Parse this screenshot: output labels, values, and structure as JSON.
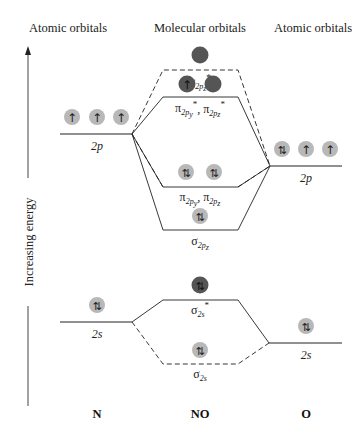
{
  "headers": {
    "left": "Atomic orbitals",
    "center": "Molecular orbitals",
    "right": "Atomic orbitals"
  },
  "axis": {
    "label": "Increasing energy"
  },
  "atoms": {
    "left": {
      "symbol": "N",
      "orbitals": [
        {
          "name": "2p",
          "electrons": [
            "↑",
            "↑",
            "↑"
          ]
        },
        {
          "name": "2s",
          "electrons": [
            "⇅"
          ]
        }
      ]
    },
    "center": {
      "symbol": "NO"
    },
    "right": {
      "symbol": "O",
      "orbitals": [
        {
          "name": "2p",
          "electrons": [
            "⇅",
            "↑",
            "↑"
          ]
        },
        {
          "name": "2s",
          "electrons": [
            "⇅"
          ]
        }
      ]
    }
  },
  "molecular_orbitals": [
    {
      "id": "sigma2pz_star",
      "label": "σ",
      "sub": "2p",
      "subsub": "z",
      "star": "*",
      "electrons": [
        ""
      ],
      "fill": "dark"
    },
    {
      "id": "pi2p_star",
      "label": "π",
      "sub": "2p",
      "subsub1": "y",
      "subsub2": "z",
      "star": "*",
      "electrons": [
        "↑",
        ""
      ],
      "fill": "dark"
    },
    {
      "id": "pi2p",
      "label": "π",
      "sub": "2p",
      "subsub1": "y",
      "subsub2": "z",
      "electrons": [
        "⇅",
        "⇅"
      ],
      "fill": "light"
    },
    {
      "id": "sigma2pz",
      "label": "σ",
      "sub": "2p",
      "subsub": "z",
      "electrons": [
        "⇅"
      ],
      "fill": "light"
    },
    {
      "id": "sigma2s_star",
      "label": "σ",
      "sub": "2s",
      "star": "*",
      "electrons": [
        "⇅"
      ],
      "fill": "dark"
    },
    {
      "id": "sigma2s",
      "label": "σ",
      "sub": "2s",
      "electrons": [
        "⇅"
      ],
      "fill": "light"
    }
  ],
  "labels": {
    "n_2p": "2p",
    "o_2p": "2p",
    "n_2s": "2s",
    "o_2s": "2s",
    "sigma": "σ",
    "pi": "π",
    "star": "*",
    "comma": ",",
    "sub_2p": "2p",
    "sub_2s": "2s",
    "x": "x",
    "y": "y",
    "z": "z"
  },
  "electrons": {
    "up": "↑",
    "pair": "⇅"
  },
  "bottom": {
    "left": "N",
    "center": "NO",
    "right": "O"
  },
  "colors": {
    "light_orbital": "#b8b8b8",
    "dark_orbital": "#555555",
    "line": "#222222"
  }
}
